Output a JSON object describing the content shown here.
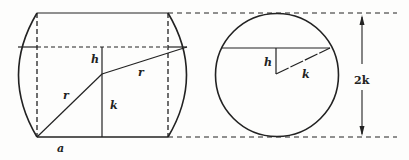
{
  "diagram": {
    "colors": {
      "stroke": "#222222",
      "background": "#fdfdfc"
    },
    "left_figure": {
      "labels": {
        "h": "h",
        "k": "k",
        "r_lower": "r",
        "r_upper": "r",
        "a": "a"
      }
    },
    "right_figure": {
      "labels": {
        "h": "h",
        "k": "k"
      }
    },
    "dimension": {
      "label": "2k"
    }
  }
}
